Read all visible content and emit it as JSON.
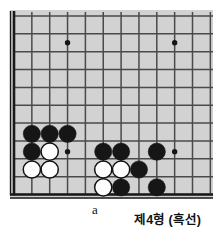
{
  "figure": {
    "type": "go-board-diagram",
    "caption": "제4형 (흑선)",
    "point_label": "a",
    "colors": {
      "board": "#d2d2d2",
      "grid_line": "#4a4a4a",
      "border_line": "#1a1a1a",
      "black_stone": "#161616",
      "white_stone": "#fdfdfd",
      "white_stone_outline": "#111111",
      "star_point": "#161616",
      "page_background": "#ffffff"
    },
    "board": {
      "origin_x": 14,
      "origin_y": 16,
      "spacing": 17.85,
      "cols": 12,
      "rows": 11,
      "left_edge_is_border": true,
      "bottom_edge_is_border": true,
      "bottom_row_index": 10,
      "stone_radius": 8.6
    },
    "star_points": [
      {
        "col": 3,
        "row": 1.5
      },
      {
        "col": 9,
        "row": 1.5
      },
      {
        "col": 3,
        "row": 7.6
      },
      {
        "col": 9,
        "row": 7.6
      }
    ],
    "stones": [
      {
        "color": "black",
        "col": 1,
        "row": 6.6
      },
      {
        "color": "black",
        "col": 2,
        "row": 6.6
      },
      {
        "color": "black",
        "col": 3,
        "row": 6.6
      },
      {
        "color": "black",
        "col": 1,
        "row": 7.6
      },
      {
        "color": "white",
        "col": 2,
        "row": 7.6
      },
      {
        "color": "black",
        "col": 5,
        "row": 7.6
      },
      {
        "color": "black",
        "col": 6,
        "row": 7.6
      },
      {
        "color": "black",
        "col": 8,
        "row": 7.6
      },
      {
        "color": "white",
        "col": 1,
        "row": 8.6
      },
      {
        "color": "white",
        "col": 2,
        "row": 8.6
      },
      {
        "color": "white",
        "col": 5,
        "row": 8.6
      },
      {
        "color": "white",
        "col": 6,
        "row": 8.6
      },
      {
        "color": "black",
        "col": 7,
        "row": 8.6
      },
      {
        "color": "white",
        "col": 5,
        "row": 9.6
      },
      {
        "color": "black",
        "col": 6,
        "row": 9.6
      },
      {
        "color": "black",
        "col": 8,
        "row": 9.6
      }
    ],
    "point_marker": {
      "col": 5,
      "row": 10.55
    }
  }
}
